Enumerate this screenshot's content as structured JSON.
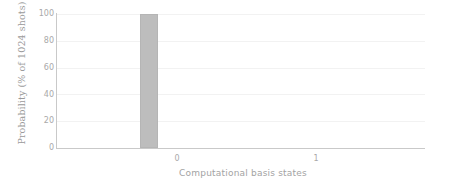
{
  "chart_data": {
    "type": "bar",
    "title": "",
    "subtitle": "",
    "xlabel": "Computational basis states",
    "ylabel": "Probability (% of 1024 shots)",
    "categories": [
      "0",
      "1"
    ],
    "values": [
      100,
      0
    ],
    "series": [
      {
        "name": "Probability",
        "values": [
          100,
          0
        ]
      }
    ],
    "xtick_labels": [
      "0",
      "1"
    ],
    "ytick_labels": [
      "0",
      "20",
      "40",
      "60",
      "80",
      "100"
    ],
    "ytick_values": [
      0,
      20,
      40,
      60,
      80,
      100
    ],
    "ylim": [
      0,
      100
    ],
    "xlim": [
      -0.5,
      1.5
    ],
    "grid": "horizontal",
    "legend": "none",
    "bar_color": "#bdbdbd",
    "grid_color": "#f2f2f2",
    "axis_color": "#c9c9c9",
    "text_color": "#a9a9a9",
    "background": "#ffffff",
    "annotations": []
  }
}
